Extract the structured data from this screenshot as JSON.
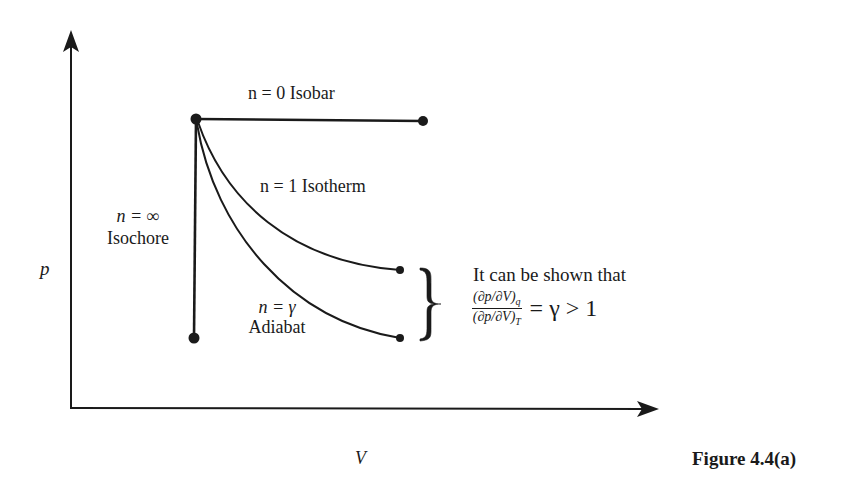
{
  "figure": {
    "caption": "Figure 4.4(a)",
    "axes": {
      "x_label": "V",
      "y_label": "p"
    },
    "processes": [
      {
        "id": "isobar",
        "exponent_label": "n = 0",
        "name": "Isobar",
        "label": "n = 0 Isobar"
      },
      {
        "id": "isotherm",
        "exponent_label": "n = 1",
        "name": "Isotherm",
        "label": "n = 1 Isotherm"
      },
      {
        "id": "isochore",
        "exponent_label": "n = ∞",
        "name": "Isochore"
      },
      {
        "id": "adiabat",
        "exponent_label": "n = γ",
        "name": "Adiabat"
      }
    ],
    "annotation": {
      "text": "It can be shown that",
      "numerator": "(∂p/∂V)",
      "numerator_sub": "q",
      "denominator": "(∂p/∂V)",
      "denominator_sub": "T",
      "relation": "= γ > 1"
    },
    "colors": {
      "ink": "#1a1a1a",
      "background": "#ffffff"
    }
  }
}
